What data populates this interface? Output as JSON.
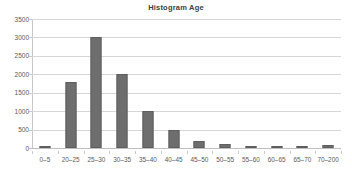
{
  "chart_data": {
    "type": "bar",
    "title": "Histogram Age",
    "xlabel": "",
    "ylabel": "",
    "categories": [
      "0–5",
      "20–25",
      "25–30",
      "30–35",
      "35–40",
      "40–45",
      "45–50",
      "50–55",
      "55–60",
      "60–65",
      "65–70",
      "70–200"
    ],
    "values": [
      50,
      1800,
      3000,
      2000,
      1000,
      500,
      200,
      100,
      50,
      30,
      20,
      80
    ],
    "ylim": [
      0,
      3500
    ],
    "ytick_labels": [
      "3500",
      "3000",
      "2500",
      "2000",
      "1500",
      "1000",
      "500",
      "0"
    ],
    "ytick_values": [
      3500,
      3000,
      2500,
      2000,
      1500,
      1000,
      500,
      0
    ],
    "ytick_step": 500,
    "grid": "horizontal",
    "legend": "none",
    "bar_color": "#6e6e6e",
    "bar_edge_color": "#5e5e5e",
    "grid_color": "#d6d6d6",
    "axis_color": "#c9c9c9",
    "text_color": "#5a5a5a",
    "title_color": "#404040",
    "background": "#ffffff"
  }
}
